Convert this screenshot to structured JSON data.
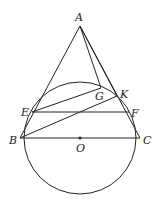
{
  "diagram": {
    "points": {
      "A": {
        "label": "A",
        "x": 80,
        "y": 26,
        "lx": 75,
        "ly": 21
      },
      "B": {
        "label": "B",
        "x": 20,
        "y": 138,
        "lx": 9,
        "ly": 144
      },
      "C": {
        "label": "C",
        "x": 140,
        "y": 138,
        "lx": 143,
        "ly": 144
      },
      "O": {
        "label": "O",
        "x": 80,
        "y": 138,
        "lx": 76,
        "ly": 152
      },
      "E": {
        "label": "E",
        "x": 32,
        "y": 112,
        "lx": 21,
        "ly": 116
      },
      "F": {
        "label": "F",
        "x": 129,
        "y": 112,
        "lx": 131,
        "ly": 117
      },
      "G": {
        "label": "G",
        "x": 101,
        "y": 88,
        "lx": 95,
        "ly": 100
      },
      "K": {
        "label": "K",
        "x": 117,
        "y": 96,
        "lx": 120,
        "ly": 98
      }
    },
    "circle": {
      "center": "O",
      "r": 56
    },
    "segments": [
      [
        "A",
        "B"
      ],
      [
        "A",
        "C"
      ],
      [
        "A",
        "G"
      ],
      [
        "A",
        "K"
      ],
      [
        "E",
        "F"
      ],
      [
        "B",
        "C"
      ],
      [
        "E",
        "G"
      ],
      [
        "B",
        "K"
      ]
    ]
  }
}
